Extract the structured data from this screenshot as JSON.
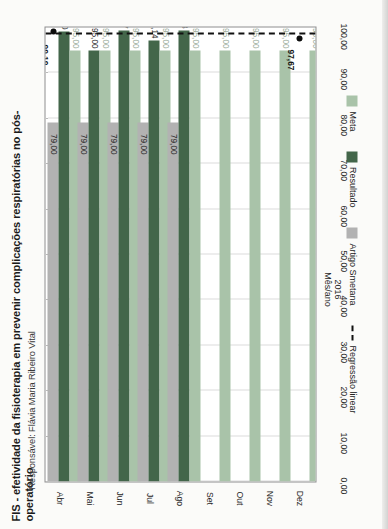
{
  "document": {
    "title": "FIS - efetividade da fisioterapia em prevenir complicações respiratórias no pós-operatório",
    "subtitle": "Responsável: Flávia Maria Ribeiro Vital"
  },
  "colors": {
    "meta": "#a9c3a9",
    "resultado": "#43664a",
    "smetana": "#b2b2b2",
    "regressao": "#111111",
    "frame": "#8d8d8d",
    "grid": "#b9b9b9"
  },
  "legend": {
    "position": "bottom",
    "items": [
      {
        "label": "Meta",
        "swatch": "meta",
        "kind": "swatch"
      },
      {
        "label": "Resultado",
        "swatch": "resultado",
        "kind": "swatch"
      },
      {
        "label": "Artigo Smetana",
        "swatch": "smetana",
        "kind": "swatch"
      },
      {
        "label": "Regressão linear",
        "swatch": "regressao",
        "kind": "dashed-line"
      }
    ]
  },
  "axis": {
    "category_title_year": "2016",
    "category_title_label": "Mês/ano",
    "value_ticks": [
      "0,00",
      "10,00",
      "20,00",
      "30,00",
      "40,00",
      "50,00",
      "60,00",
      "70,00",
      "80,00",
      "90,00",
      "100,00"
    ]
  },
  "annotations": {
    "projection_label": "99,19",
    "projection_marker": "dot",
    "arrow_glyph": "➜",
    "trend_point_abr": "97,67"
  },
  "chart_data": {
    "type": "bar",
    "orientation": "horizontal",
    "title": "FIS - efetividade da fisioterapia em prevenir complicações respiratórias no pós-operatório",
    "subtitle": "Responsável: Flávia Maria Ribeiro Vital",
    "xlabel": "2016 Mês/ano",
    "ylabel": "",
    "xlim": [
      0,
      100
    ],
    "grid": true,
    "categories": [
      "Abr",
      "Mai",
      "Jun",
      "Jul",
      "Ago",
      "Set",
      "Out",
      "Nov",
      "Dez"
    ],
    "series": [
      {
        "name": "Meta",
        "color": "#a9c3a9",
        "values": [
          95.0,
          95.0,
          95.0,
          95.0,
          95.0,
          95.0,
          95.0,
          95.0,
          95.0
        ],
        "labels": [
          "95,00",
          "95,00",
          "95,00",
          "95,00",
          "95,00",
          "95,00",
          "95,00",
          "95,00",
          "95,00"
        ]
      },
      {
        "name": "Resultado",
        "color": "#43664a",
        "values": [
          99.1,
          95.0,
          99.27,
          97.14,
          99.23,
          null,
          null,
          null,
          null
        ],
        "labels": [
          "99,10",
          "95,00",
          "99,27",
          "97,14",
          "99,23",
          "",
          "",
          "",
          ""
        ]
      },
      {
        "name": "Artigo Smetana",
        "color": "#b2b2b2",
        "values": [
          79.0,
          79.0,
          79.0,
          79.0,
          79.0,
          null,
          null,
          null,
          null
        ],
        "labels": [
          "79,00",
          "79,00",
          "79,00",
          "79,00",
          "79,00",
          "",
          "",
          "",
          ""
        ]
      }
    ],
    "trendline": {
      "name": "Regressão linear",
      "style": "dashed",
      "color": "#111111",
      "start": {
        "category": "Abr",
        "value": 97.67,
        "label": "97,67"
      },
      "end": {
        "category": "Dez",
        "value": 99.19,
        "label": "99,19"
      }
    }
  }
}
